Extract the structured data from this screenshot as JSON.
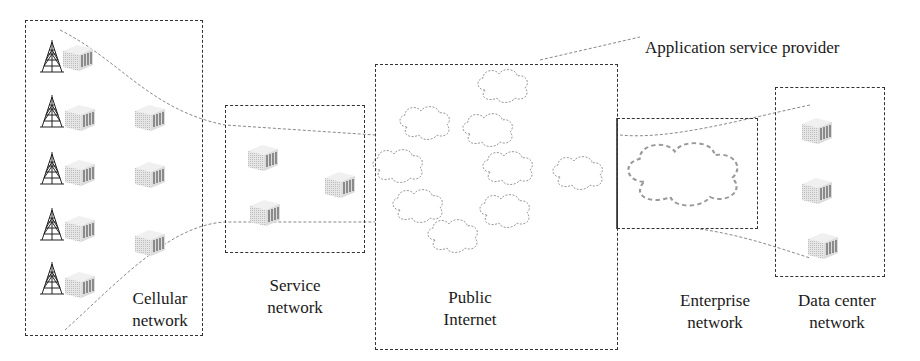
{
  "diagram": {
    "type": "network-architecture",
    "callout": "Application service provider",
    "regions": [
      {
        "id": "cellular",
        "line1": "Cellular",
        "line2": "network"
      },
      {
        "id": "service",
        "line1": "Service",
        "line2": "network"
      },
      {
        "id": "public",
        "line1": "Public",
        "line2": "Internet"
      },
      {
        "id": "enterprise",
        "line1": "Enterprise",
        "line2": "network"
      },
      {
        "id": "datacenter",
        "line1": "Data center",
        "line2": "network"
      }
    ],
    "icons": {
      "tower": "cell-tower-icon",
      "server": "server-icon",
      "cloud": "cloud-icon"
    },
    "counts": {
      "cellular_towers": 5,
      "cellular_servers": 3,
      "service_servers": 3,
      "internet_clouds": 8,
      "enterprise_clouds": 1,
      "datacenter_servers": 3
    }
  }
}
